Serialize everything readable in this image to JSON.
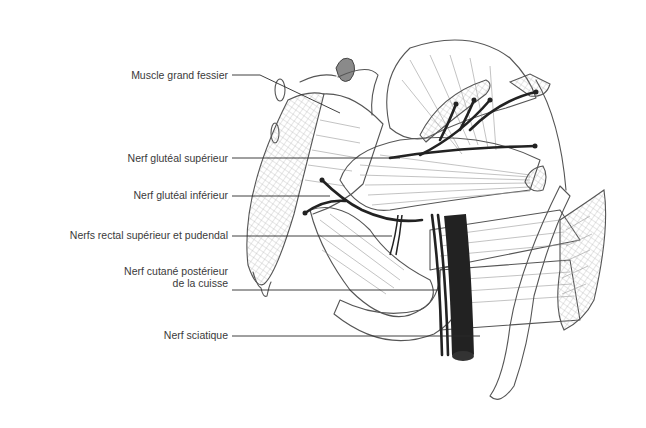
{
  "figure": {
    "type": "anatomical-line-drawing"
  },
  "labels": [
    {
      "id": "muscle-grand-fessier",
      "text": "Muscle grand fessier",
      "x": 90,
      "y": 69,
      "w": 138,
      "leader": [
        [
          232,
          75
        ],
        [
          260,
          75
        ],
        [
          340,
          113
        ]
      ]
    },
    {
      "id": "nerf-gluteal-superieur",
      "text": "Nerf glutéal supérieur",
      "x": 70,
      "y": 152,
      "w": 158,
      "leader": [
        [
          232,
          158
        ],
        [
          400,
          158
        ]
      ]
    },
    {
      "id": "nerf-gluteal-inferieur",
      "text": "Nerf glutéal inférieur",
      "x": 70,
      "y": 189,
      "w": 158,
      "leader": [
        [
          232,
          196
        ],
        [
          330,
          196
        ]
      ]
    },
    {
      "id": "nerfs-rectal-pudendal",
      "text": "Nerfs rectal supérieur et pudendal",
      "x": 10,
      "y": 229,
      "w": 218,
      "leader": [
        [
          232,
          236
        ],
        [
          392,
          236
        ]
      ]
    },
    {
      "id": "nerf-cutane-posterieur",
      "text": "Nerf cutané postérieur",
      "text2": "de la cuisse",
      "x": 70,
      "y": 265,
      "w": 158,
      "leader": [
        [
          232,
          290
        ],
        [
          440,
          290
        ]
      ]
    },
    {
      "id": "nerf-sciatique",
      "text": "Nerf sciatique",
      "x": 70,
      "y": 329,
      "w": 158,
      "leader": [
        [
          232,
          336
        ],
        [
          480,
          336
        ]
      ]
    }
  ]
}
